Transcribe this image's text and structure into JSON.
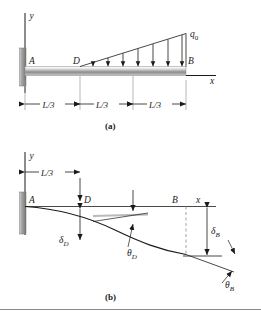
{
  "figure": {
    "kind": "engineering-beam-diagram",
    "panels": [
      {
        "id": "a",
        "caption": "(a)",
        "axis_y": "y",
        "axis_x": "x",
        "points": [
          {
            "name": "A",
            "label": "A"
          },
          {
            "name": "D",
            "label": "D"
          },
          {
            "name": "B",
            "label": "B"
          }
        ],
        "load_label": "q0",
        "load_label_base": "q",
        "load_label_sub": "0",
        "load_type": "triangular-distributed",
        "load_arrow_count": 7,
        "support": "fixed-wall-left",
        "dimensions": [
          {
            "label": "L/3"
          },
          {
            "label": "L/3"
          },
          {
            "label": "L/3"
          }
        ]
      },
      {
        "id": "b",
        "caption": "(b)",
        "axis_y": "y",
        "axis_x": "x",
        "points": [
          {
            "name": "A",
            "label": "A"
          },
          {
            "name": "D",
            "label": "D"
          },
          {
            "name": "B",
            "label": "B"
          }
        ],
        "dimensions": [
          {
            "label": "L/3"
          }
        ],
        "annotations": [
          {
            "name": "deflection-at-D",
            "base": "δ",
            "sub": "D"
          },
          {
            "name": "slope-at-D",
            "base": "θ",
            "sub": "D"
          },
          {
            "name": "deflection-at-B",
            "base": "δ",
            "sub": "B"
          },
          {
            "name": "slope-at-B",
            "base": "θ",
            "sub": "B"
          }
        ],
        "curve": "deflection-curve"
      }
    ],
    "colors": {
      "line": "#1a1a1a",
      "beam_top": "#f2f2f2",
      "beam_mid": "#8f8f8f",
      "beam_bottom": "#bdbdbd",
      "wall": "#9a9a9a",
      "divider": "#8a8a8a",
      "dashed": "#9a9a9a"
    }
  }
}
